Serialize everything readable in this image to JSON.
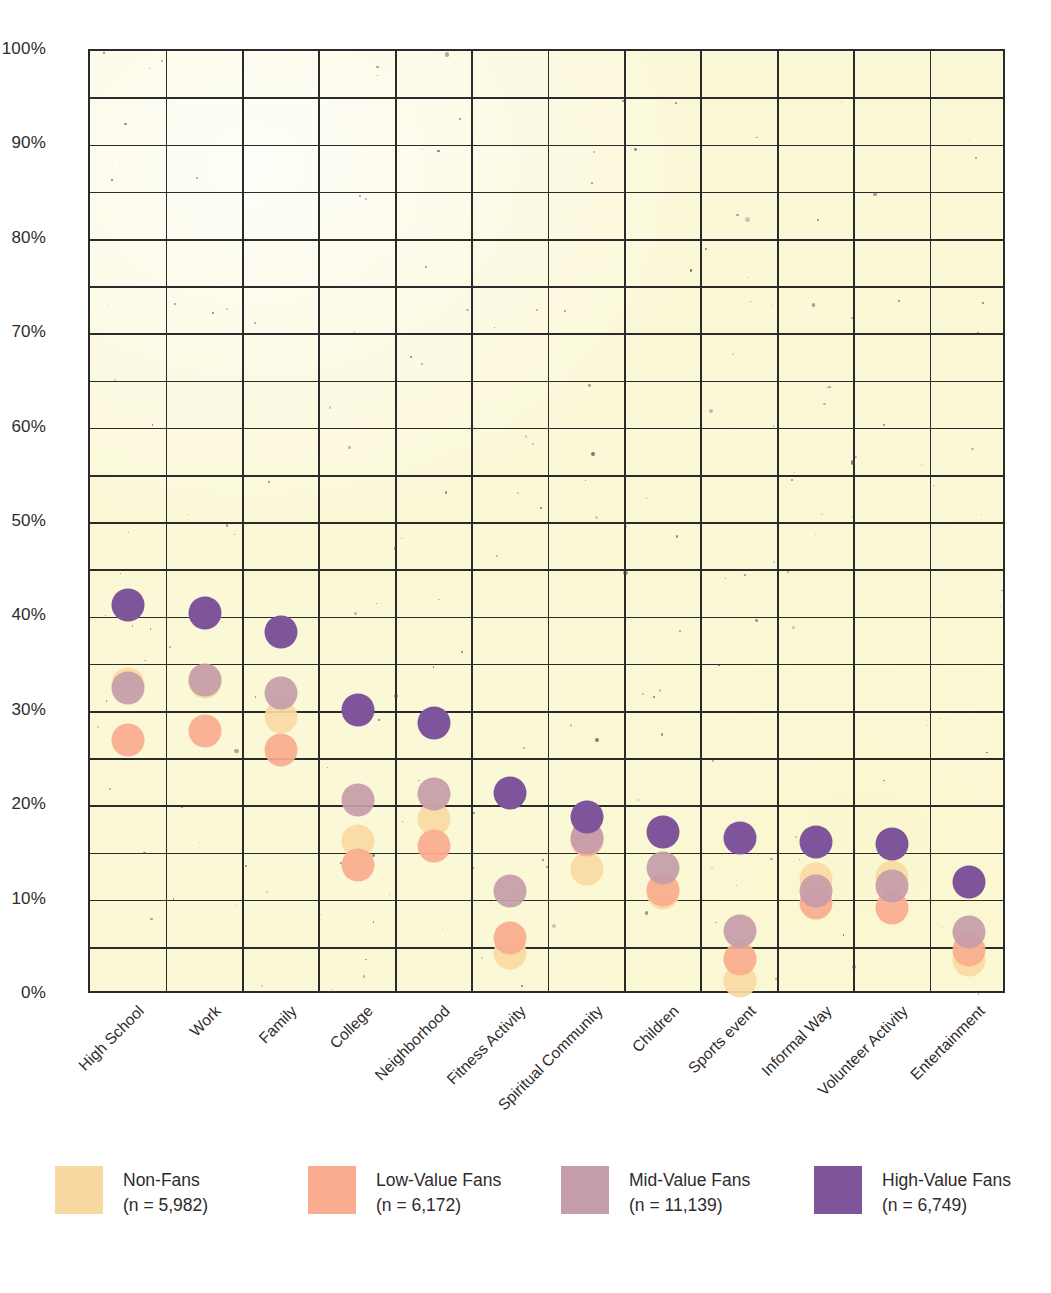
{
  "chart_data": {
    "type": "scatter",
    "title": "",
    "subtitle": "",
    "xlabel": "",
    "ylabel": "",
    "ylim": [
      0,
      100
    ],
    "yticks": [
      "0%",
      "10%",
      "20%",
      "30%",
      "40%",
      "50%",
      "60%",
      "70%",
      "80%",
      "90%",
      "100%"
    ],
    "ytick_values": [
      0,
      10,
      20,
      30,
      40,
      50,
      60,
      70,
      80,
      90,
      100
    ],
    "grid": true,
    "grid_step": 5,
    "legend_position": "bottom",
    "categories": [
      "High School",
      "Work",
      "Family",
      "College",
      "Neighborhood",
      "Fitness Activity",
      "Spiritual Community",
      "Children",
      "Sports event",
      "Informal Way",
      "Volunteer Activity",
      "Entertainment"
    ],
    "series": [
      {
        "name": "Non-Fans",
        "n": "5,982",
        "label": "Non-Fans",
        "sublabel": "(n = 5,982)",
        "color": "#f8d9a2",
        "values": [
          33.0,
          33.2,
          29.5,
          16.3,
          18.7,
          4.5,
          13.4,
          10.8,
          1.5,
          12.3,
          12.5,
          3.7
        ]
      },
      {
        "name": "Low-Value Fans",
        "n": "6,172",
        "label": "Low-Value Fans",
        "sublabel": "(n = 6,172)",
        "color": "#f9ad8e",
        "values": [
          27.0,
          28.0,
          26.0,
          13.8,
          15.8,
          6.0,
          16.4,
          11.1,
          3.8,
          9.8,
          9.2,
          4.8
        ]
      },
      {
        "name": "Mid-Value Fans",
        "n": "11,139",
        "label": "Mid-Value Fans",
        "sublabel": "(n = 11,139)",
        "color": "#c59ca9",
        "values": [
          32.5,
          33.4,
          32.0,
          20.7,
          21.3,
          11.0,
          16.6,
          13.5,
          6.8,
          11.0,
          11.5,
          6.7
        ]
      },
      {
        "name": "High-Value Fans",
        "n": "6,749",
        "label": "High-Value Fans",
        "sublabel": "(n = 6,749)",
        "color": "#7e559b",
        "values": [
          41.3,
          40.5,
          38.5,
          30.2,
          28.8,
          21.4,
          18.9,
          17.3,
          16.6,
          16.2,
          16.0,
          12.0
        ]
      }
    ]
  },
  "axes": {
    "y_ticks": [
      "100%",
      "90%",
      "80%",
      "70%",
      "60%",
      "50%",
      "40%",
      "30%",
      "20%",
      "10%",
      "0%"
    ]
  },
  "legend": {
    "entries": [
      {
        "label": "Non-Fans",
        "sublabel": "(n = 5,982)",
        "color": "#f8d9a2"
      },
      {
        "label": "Low-Value Fans",
        "sublabel": "(n = 6,172)",
        "color": "#f9ad8e"
      },
      {
        "label": "Mid-Value Fans",
        "sublabel": "(n = 11,139)",
        "color": "#c59ca9"
      },
      {
        "label": "High-Value Fans",
        "sublabel": "(n = 6,749)",
        "color": "#7e559b"
      }
    ]
  },
  "colors": {
    "plot_background": "#fbf8d8",
    "grid_line": "#2b2b2b",
    "text": "#2f2b2c",
    "page_background": "#ffffff"
  }
}
